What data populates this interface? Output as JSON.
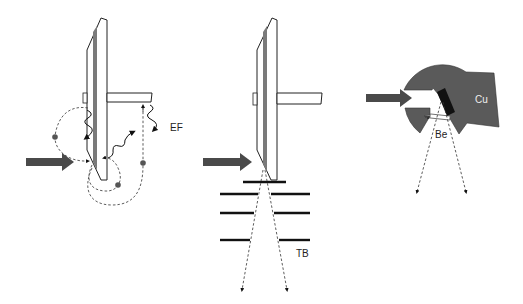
{
  "diagram": {
    "panels": [
      {
        "id": "panel-electron-fluorescence",
        "label": "EF",
        "description": "Target with rod; incident beam arrow; dashed electron trajectories with wavy emission arrows"
      },
      {
        "id": "panel-transmission-baffles",
        "label": "TB",
        "description": "Target with rod; incident beam arrow; stacked baffle plates; diverging dashed rays"
      },
      {
        "id": "panel-copper-block",
        "labels": {
          "block": "Cu",
          "window": "Be"
        },
        "description": "Copper housing with beryllium window; incident beam arrow; diverging dashed rays"
      }
    ],
    "colors": {
      "beam_arrow": "#4a4a4a",
      "copper_block": "#5a5a5a",
      "target_stripe": "#7a7a7a",
      "line": "#222222",
      "background": "#ffffff"
    }
  }
}
